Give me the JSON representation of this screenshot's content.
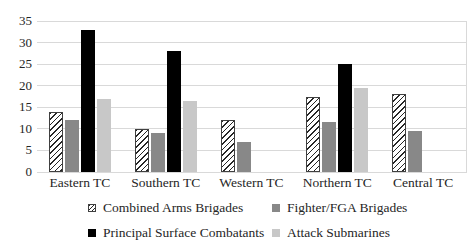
{
  "chart_data": {
    "type": "bar",
    "title": "",
    "xlabel": "",
    "ylabel": "",
    "categories": [
      "Eastern TC",
      "Southern TC",
      "Western TC",
      "Northern TC",
      "Central TC"
    ],
    "series": [
      {
        "name": "Combined Arms Brigades",
        "pattern": "diagonal-hatch",
        "fill": "#ffffff",
        "stroke": "#262626",
        "values": [
          14,
          10,
          12,
          17.5,
          18
        ]
      },
      {
        "name": "Fighter/FGA Brigades",
        "pattern": "solid",
        "fill": "#888888",
        "values": [
          12,
          9,
          7,
          11.5,
          9.5
        ]
      },
      {
        "name": "Principal Surface Combatants",
        "pattern": "solid",
        "fill": "#000000",
        "values": [
          33,
          28,
          null,
          25,
          null
        ]
      },
      {
        "name": "Attack Submarines",
        "pattern": "solid",
        "fill": "#c8c8c8",
        "values": [
          17,
          16.5,
          null,
          19.5,
          null
        ]
      }
    ],
    "ylim": [
      0,
      35
    ],
    "yticks": [
      0,
      5,
      10,
      15,
      20,
      25,
      30,
      35
    ],
    "grid": true,
    "legend_position": "bottom",
    "gridline_color": "#d9d9d9",
    "text_color": "#262626"
  }
}
